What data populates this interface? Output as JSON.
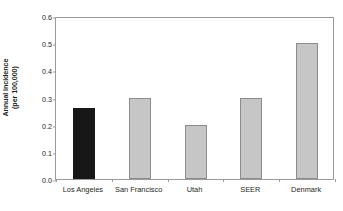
{
  "chart_data": {
    "type": "bar",
    "title": "",
    "subtitle": "",
    "xlabel": "",
    "ylabel": "Annual incidence (per 100,000)",
    "ylabel_line1": "Annual incidence",
    "ylabel_line2": "(per 100,000)",
    "categories": [
      "Los Angeles",
      "San Francisco",
      "Utah",
      "SEER",
      "Denmark"
    ],
    "values": [
      0.26,
      0.3,
      0.2,
      0.3,
      0.5
    ],
    "ylim": [
      0.0,
      0.6
    ],
    "ytick_values": [
      0.0,
      0.1,
      0.2,
      0.3,
      0.4,
      0.5,
      0.6
    ],
    "ytick_labels": [
      "0.0",
      "0.1",
      "0.2",
      "0.3",
      "0.4",
      "0.5",
      "0.6"
    ],
    "grid": false,
    "legend": null,
    "legend_position": "none",
    "bar_colors": [
      "#171717",
      "#c6c6c6",
      "#c6c6c6",
      "#c6c6c6",
      "#c6c6c6"
    ],
    "bar_border_colors": [
      "#171717",
      "#8c8c8c",
      "#8c8c8c",
      "#8c8c8c",
      "#8c8c8c"
    ],
    "highlight_category": "Los Angeles",
    "axis_color": "#9a9a9a",
    "text_color": "#231f20",
    "background_color": "#ffffff"
  }
}
